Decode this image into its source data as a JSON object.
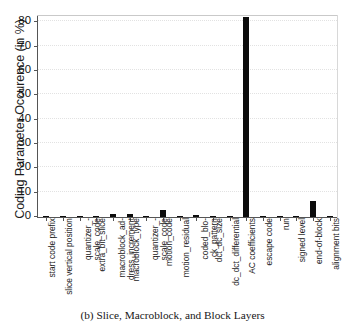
{
  "chart_data": {
    "type": "bar",
    "title": "",
    "caption": "(b) Slice, Macroblock, and Block Layers",
    "xlabel": "",
    "ylabel": "Coding Parameter Occurence (in %)",
    "ylim": [
      0,
      83
    ],
    "yticks": [
      0,
      10,
      20,
      30,
      40,
      50,
      60,
      70,
      80
    ],
    "ytick_labels": [
      "0",
      "10",
      "20",
      "30",
      "40",
      "50",
      "60",
      "70",
      "80"
    ],
    "grid": false,
    "legend": "none",
    "bar_color": "#0c0c0c",
    "categories": [
      "start code prefix",
      "slice vertical position",
      "quantizer_-\nscale_code",
      "extra_bit_slice",
      "macroblock_ad-\ndress_increment",
      "macroblock_type",
      "quantizer_-\nscale_code",
      "motion_code",
      "motion_residual",
      "coded_blo-\nck_pattern",
      "dct_dc_size",
      "dc_dct_differential",
      "AC coefficients",
      "escape code",
      "run",
      "signed level",
      "end-of-block",
      "alignment bits"
    ],
    "category_lines": [
      [
        "start code prefix"
      ],
      [
        "slice vertical position"
      ],
      [
        "quantizer_-",
        "scale_code"
      ],
      [
        "extra_bit_slice"
      ],
      [
        "macroblock_ad-",
        "dress_increment"
      ],
      [
        "macroblock_type"
      ],
      [
        "quantizer_-",
        "scale_code"
      ],
      [
        "motion_code"
      ],
      [
        "motion_residual"
      ],
      [
        "coded_blo-",
        "ck_pattern"
      ],
      [
        "dct_dc_size"
      ],
      [
        "dc_dct_differential"
      ],
      [
        "AC coefficients"
      ],
      [
        "escape code"
      ],
      [
        "run"
      ],
      [
        "signed level"
      ],
      [
        "end-of-block"
      ],
      [
        "alignment bits"
      ]
    ],
    "values": [
      0.05,
      0.05,
      0.1,
      0.05,
      1.2,
      1.3,
      0.5,
      2.7,
      0.05,
      1.0,
      0.4,
      0.1,
      82.0,
      0.1,
      0.3,
      0.05,
      6.4,
      0.05
    ]
  }
}
